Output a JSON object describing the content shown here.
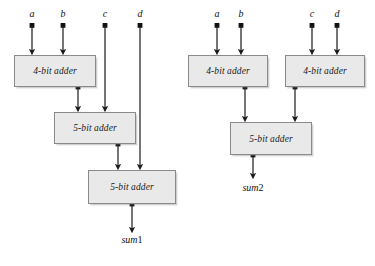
{
  "figure": {
    "background_color": "#ffffff",
    "box_fill_color": "#e9e9e9",
    "box_border_color": "#8a8a8a",
    "wire_color": "#1a1a1a"
  },
  "diagrams": [
    {
      "id": "serial-adder-network",
      "name": "left-diagram",
      "output_label_italic": "sum",
      "output_label_number": "1",
      "inputs": [
        {
          "label": "a",
          "x": 32,
          "y": 17,
          "wire_from_y": 25,
          "wire_to_y": 53
        },
        {
          "label": "b",
          "x": 63,
          "y": 17,
          "wire_from_y": 25,
          "wire_to_y": 53
        },
        {
          "label": "c",
          "x": 105,
          "y": 17,
          "wire_from_y": 25,
          "wire_to_y": 110
        },
        {
          "label": "d",
          "x": 140,
          "y": 17,
          "wire_from_y": 25,
          "wire_to_y": 168
        }
      ],
      "boxes": [
        {
          "label": "4-bit adder",
          "x": 14,
          "y": 55,
          "w": 82,
          "h": 32
        },
        {
          "label": "5-bit adder",
          "x": 54,
          "y": 112,
          "w": 82,
          "h": 32
        },
        {
          "label": "5-bit adder",
          "x": 88,
          "y": 170,
          "w": 88,
          "h": 34
        }
      ],
      "wires": [
        {
          "from": "4-bit-adder-out",
          "x": 78,
          "y1": 87,
          "y2": 110
        },
        {
          "from": "5-bit-adder-1-out",
          "x": 118,
          "y1": 144,
          "y2": 168
        },
        {
          "from": "5-bit-adder-2-out",
          "x": 132,
          "y1": 204,
          "y2": 232
        }
      ],
      "output": {
        "x": 132,
        "y": 236
      }
    },
    {
      "id": "tree-adder-network",
      "name": "right-diagram",
      "output_label_italic": "sum",
      "output_label_number": "2",
      "inputs": [
        {
          "label": "a",
          "x": 217,
          "y": 17,
          "wire_from_y": 25,
          "wire_to_y": 53
        },
        {
          "label": "b",
          "x": 241,
          "y": 17,
          "wire_from_y": 25,
          "wire_to_y": 53
        },
        {
          "label": "c",
          "x": 312,
          "y": 17,
          "wire_from_y": 25,
          "wire_to_y": 53
        },
        {
          "label": "d",
          "x": 337,
          "y": 17,
          "wire_from_y": 25,
          "wire_to_y": 53
        }
      ],
      "boxes": [
        {
          "label": "4-bit adder",
          "x": 188,
          "y": 55,
          "w": 80,
          "h": 32
        },
        {
          "label": "4-bit adder",
          "x": 285,
          "y": 55,
          "w": 80,
          "h": 32
        },
        {
          "label": "5-bit adder",
          "x": 230,
          "y": 122,
          "w": 82,
          "h": 33
        }
      ],
      "wires": [
        {
          "from": "4-bit-adder-left-out",
          "x": 245,
          "y1": 87,
          "y2": 120
        },
        {
          "from": "4-bit-adder-right-out",
          "x": 295,
          "y1": 87,
          "y2": 120
        },
        {
          "from": "5-bit-adder-out",
          "x": 253,
          "y1": 155,
          "y2": 178
        }
      ],
      "output": {
        "x": 253,
        "y": 192
      }
    }
  ]
}
